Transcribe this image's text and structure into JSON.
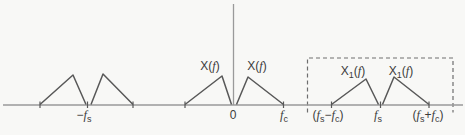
{
  "colors": {
    "background": "#f8f8f6",
    "axis": "#9a9a9a",
    "line": "#585858",
    "dashed": "#6e6e6e",
    "text": "#3c3c3c"
  },
  "labels": {
    "xf_left": {
      "text": "X(f)",
      "segments": [
        {
          "t": "X("
        },
        {
          "t": "f",
          "it": true
        },
        {
          "t": ")"
        }
      ]
    },
    "xf_right": {
      "text": "X(f)",
      "segments": [
        {
          "t": "X("
        },
        {
          "t": "f",
          "it": true
        },
        {
          "t": ")"
        }
      ]
    },
    "x1f_left": {
      "text": "X1(f)",
      "segments": [
        {
          "t": "X"
        },
        {
          "t": "1",
          "sub": true
        },
        {
          "t": "("
        },
        {
          "t": "f",
          "it": true
        },
        {
          "t": ")"
        }
      ]
    },
    "x1f_right": {
      "text": "X1(f)",
      "segments": [
        {
          "t": "X"
        },
        {
          "t": "1",
          "sub": true
        },
        {
          "t": "("
        },
        {
          "t": "f",
          "it": true
        },
        {
          "t": ")"
        }
      ]
    },
    "neg_fs": {
      "text": "-fs",
      "segments": [
        {
          "t": "−"
        },
        {
          "t": "f",
          "it": true
        },
        {
          "t": "s",
          "sub": true
        }
      ]
    },
    "zero": {
      "text": "0",
      "segments": [
        {
          "t": "0"
        }
      ]
    },
    "fc": {
      "text": "fc",
      "segments": [
        {
          "t": "f",
          "it": true
        },
        {
          "t": "c",
          "sub": true
        }
      ]
    },
    "fs_minus_fc": {
      "text": "(fs-fc)",
      "segments": [
        {
          "t": "("
        },
        {
          "t": "f",
          "it": true
        },
        {
          "t": "s",
          "sub": true
        },
        {
          "t": "−"
        },
        {
          "t": "f",
          "it": true
        },
        {
          "t": "c",
          "sub": true
        },
        {
          "t": ")"
        }
      ]
    },
    "fs": {
      "text": "fs",
      "segments": [
        {
          "t": "f",
          "it": true
        },
        {
          "t": "s",
          "sub": true
        }
      ]
    },
    "fs_plus_fc": {
      "text": "(fs+fc)",
      "segments": [
        {
          "t": "("
        },
        {
          "t": "f",
          "it": true
        },
        {
          "t": "s",
          "sub": true
        },
        {
          "t": "+"
        },
        {
          "t": "f",
          "it": true
        },
        {
          "t": "c",
          "sub": true
        },
        {
          "t": ")"
        }
      ]
    }
  }
}
